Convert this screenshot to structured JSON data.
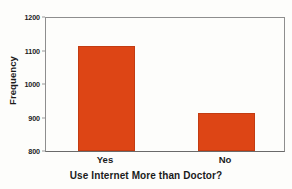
{
  "chart_data": {
    "type": "bar",
    "title": "",
    "xlabel": "Use Internet More than Doctor?",
    "ylabel": "Frequency",
    "categories": [
      "Yes",
      "No"
    ],
    "values": [
      1112,
      912
    ],
    "ylim": [
      800,
      1200
    ],
    "yticks": [
      800,
      900,
      1000,
      1100,
      1200
    ],
    "ytick_labels": [
      "800",
      "900",
      "1000",
      "1100",
      "1200"
    ],
    "grid": false,
    "legend": null,
    "bar_color": "#dd4515",
    "axis_color": "#8e8e8e",
    "text_color": "#1b1b1b",
    "background": "#fdfdfb"
  }
}
